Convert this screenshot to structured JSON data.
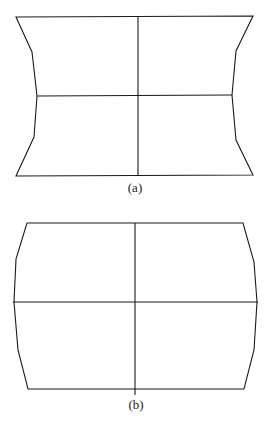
{
  "figure": {
    "panels": [
      {
        "id": "a",
        "caption": "(a)",
        "description": "Pincushion distortion of a rectangular grid: sides bow inward",
        "outline_points": "16,17 253,16 236,51 232,95 236,140 253,175 16,176 34,137 37,96 32,52",
        "horizontal_line": {
          "x1": 37,
          "y1": 96,
          "x2": 232,
          "y2": 95
        },
        "vertical_line": {
          "x1": 138,
          "y1": 16,
          "x2": 138,
          "y2": 176
        },
        "caption_pos": {
          "x": 135,
          "y": 192
        }
      },
      {
        "id": "b",
        "caption": "(b)",
        "description": "Barrel distortion of a rectangular grid: sides bow outward",
        "outline_points": "27,223 243,223 254,262 257,302 254,350 244,389 28,389 18,350 14,302 16,259",
        "horizontal_line": {
          "x1": 13,
          "y1": 302,
          "x2": 258,
          "y2": 302
        },
        "vertical_line": {
          "x1": 135,
          "y1": 223,
          "x2": 135,
          "y2": 395
        },
        "caption_pos": {
          "x": 136,
          "y": 409
        }
      }
    ],
    "colors": {
      "stroke": "#1a1a1a",
      "background": "#ffffff"
    }
  }
}
